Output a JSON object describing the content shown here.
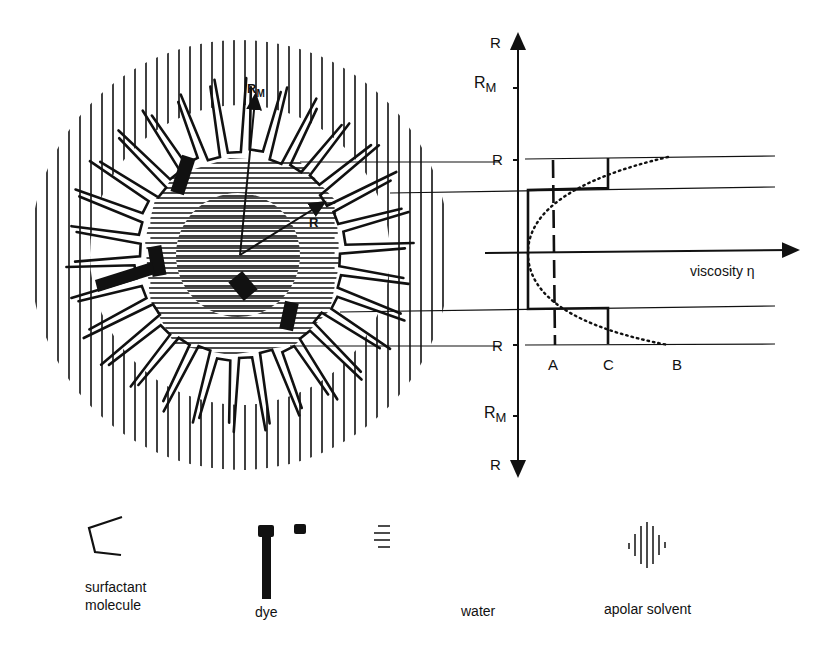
{
  "diagram": {
    "micelle": {
      "labels": {
        "outer_radius": "R",
        "outer_radius_sub": "M",
        "core_radius": "R"
      }
    },
    "profile": {
      "axis_labels": {
        "top": "R",
        "rm_top": "R",
        "rm_top_sub": "M",
        "r_upper": "R",
        "r_lower": "R",
        "rm_bottom": "R",
        "rm_bottom_sub": "M",
        "bottom": "R"
      },
      "x_axis_label": "viscosity η",
      "curve_labels": {
        "a": "A",
        "b": "B",
        "c": "C"
      },
      "curves": [
        {
          "id": "A",
          "style": "dashed",
          "description": "constant viscosity"
        },
        {
          "id": "B",
          "style": "dotted",
          "description": "parabolic viscosity increasing toward interface"
        },
        {
          "id": "C",
          "style": "solid",
          "description": "step profile: low in core, high near interface"
        }
      ]
    },
    "legend": [
      {
        "id": "surfactant",
        "label_line1": "surfactant",
        "label_line2": "molecule",
        "icon": "surfactant-icon"
      },
      {
        "id": "dye",
        "label_line1": "dye",
        "label_line2": "",
        "icon": "dye-icon"
      },
      {
        "id": "water",
        "label_line1": "water",
        "label_line2": "",
        "icon": "water-hatch-icon"
      },
      {
        "id": "apolar",
        "label_line1": "apolar solvent",
        "label_line2": "",
        "icon": "apolar-hatch-icon"
      }
    ],
    "colors": {
      "ink": "#111111",
      "background": "#ffffff"
    }
  }
}
